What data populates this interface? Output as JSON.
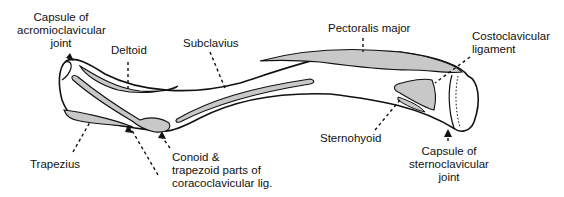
{
  "diagram": {
    "colors": {
      "bone_fill": "#ffffff",
      "outline": "#111111",
      "attachment_fill": "#c8c8c8",
      "text": "#111111"
    },
    "labels": {
      "capsule_acromioclavicular": [
        "Capsule of",
        "acromioclavicular",
        "joint"
      ],
      "deltoid": "Deltoid",
      "subclavius": "Subclavius",
      "pectoralis_major": "Pectoralis major",
      "costoclavicular_ligament": [
        "Costoclavicular",
        "ligament"
      ],
      "trapezius": "Trapezius",
      "conoid_trapezoid": [
        "Conoid &",
        "trapezoid parts of",
        "coracoclavicular lig."
      ],
      "sternohyoid": "Sternohyoid",
      "capsule_sternoclavicular": [
        "Capsule of",
        "sternoclavicular",
        "joint"
      ]
    }
  }
}
